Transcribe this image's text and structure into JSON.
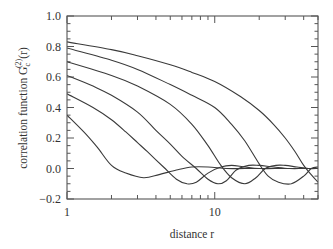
{
  "chart_data": {
    "type": "line",
    "title": "",
    "xlabel": "distance r",
    "ylabel": "correlation function G_c^(2)(r)",
    "ylabel_parts": {
      "main": "correlation function G",
      "sub": "c",
      "sup": "(2)",
      "tail": "(r)"
    },
    "xscale": "log",
    "xlim": [
      1,
      50
    ],
    "ylim": [
      -0.2,
      1.0
    ],
    "grid": false,
    "legend": null,
    "x_tick_labels": [
      {
        "value": 1,
        "label": "1"
      },
      {
        "value": 10,
        "label": "10"
      }
    ],
    "y_tick_labels": [
      {
        "value": 1.0,
        "label": "1.0"
      },
      {
        "value": 0.8,
        "label": "0.8"
      },
      {
        "value": 0.6,
        "label": "0.6"
      },
      {
        "value": 0.4,
        "label": "0.4"
      },
      {
        "value": 0.2,
        "label": "0.2"
      },
      {
        "value": 0.0,
        "label": "0.0"
      },
      {
        "value": -0.2,
        "label": "-0.2"
      }
    ],
    "series": [
      {
        "name": "curve-1",
        "x": [
          1,
          2,
          3,
          5,
          7,
          10,
          15,
          20,
          25,
          30,
          35,
          40,
          45,
          50
        ],
        "values": [
          0.83,
          0.78,
          0.74,
          0.68,
          0.63,
          0.57,
          0.47,
          0.38,
          0.29,
          0.2,
          0.11,
          0.02,
          -0.04,
          -0.09
        ]
      },
      {
        "name": "curve-2",
        "x": [
          1,
          2,
          3,
          5,
          7,
          10,
          13,
          16,
          20,
          23,
          27,
          33,
          40,
          45,
          50
        ],
        "values": [
          0.79,
          0.71,
          0.65,
          0.55,
          0.48,
          0.4,
          0.29,
          0.18,
          0.03,
          -0.05,
          -0.09,
          -0.1,
          -0.05,
          0.0,
          0.01
        ]
      },
      {
        "name": "curve-3",
        "x": [
          1,
          2,
          3,
          5,
          7,
          9,
          11,
          13,
          16,
          19,
          22,
          26,
          30,
          36,
          43,
          50
        ],
        "values": [
          0.7,
          0.61,
          0.54,
          0.42,
          0.29,
          0.15,
          0.02,
          -0.06,
          -0.1,
          -0.06,
          0.0,
          0.02,
          0.02,
          0.01,
          0.0,
          0.0
        ]
      },
      {
        "name": "curve-4",
        "x": [
          1,
          1.5,
          2,
          3,
          4,
          5,
          6,
          7.5,
          9,
          10.5,
          12,
          14,
          17,
          20,
          25,
          32,
          40,
          50
        ],
        "values": [
          0.61,
          0.54,
          0.48,
          0.37,
          0.25,
          0.16,
          0.08,
          0.0,
          -0.07,
          -0.1,
          -0.08,
          -0.01,
          0.02,
          0.02,
          0.01,
          0.0,
          0.0,
          0.0
        ]
      },
      {
        "name": "curve-5",
        "x": [
          1,
          1.5,
          2,
          2.5,
          3,
          3.5,
          4.5,
          5.5,
          6.5,
          7.5,
          9,
          11,
          13,
          16,
          20,
          30,
          50
        ],
        "values": [
          0.49,
          0.4,
          0.32,
          0.24,
          0.17,
          0.11,
          0.01,
          -0.07,
          -0.1,
          -0.09,
          -0.03,
          0.01,
          0.02,
          0.01,
          0.0,
          0.0,
          0.0
        ]
      },
      {
        "name": "curve-6",
        "x": [
          1,
          1.3,
          1.6,
          2.0,
          2.5,
          3.3,
          4.2,
          5.5,
          7,
          9,
          12,
          16,
          25,
          50
        ],
        "values": [
          0.35,
          0.24,
          0.14,
          0.02,
          -0.03,
          -0.06,
          -0.04,
          -0.01,
          0.01,
          0.01,
          0.0,
          0.0,
          0.0,
          0.0
        ]
      }
    ]
  },
  "style": {
    "line_color": "#3a3a3a",
    "frame_color": "#555555",
    "background": "#ffffff"
  }
}
